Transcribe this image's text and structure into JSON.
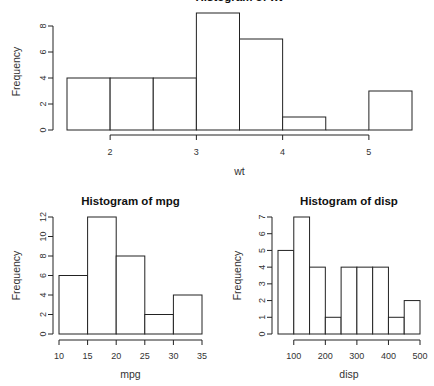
{
  "chart_data": [
    {
      "type": "bar",
      "title": "",
      "xlabel": "wt",
      "ylabel": "Frequency",
      "bin_edges": [
        1.5,
        2.0,
        2.5,
        3.0,
        3.5,
        4.0,
        4.5,
        5.0,
        5.5
      ],
      "values": [
        4,
        4,
        4,
        9,
        7,
        1,
        0,
        3
      ],
      "xticks": [
        "2",
        "3",
        "4",
        "5"
      ],
      "xtick_values": [
        2,
        3,
        4,
        5
      ],
      "yticks": [
        "0",
        "2",
        "4",
        "6",
        "8"
      ],
      "ylim": [
        0,
        9
      ],
      "grid": false
    },
    {
      "type": "bar",
      "title": "Histogram of mpg",
      "xlabel": "mpg",
      "ylabel": "Frequency",
      "bin_edges": [
        10,
        15,
        20,
        25,
        30,
        35
      ],
      "values": [
        6,
        12,
        8,
        2,
        4
      ],
      "xticks": [
        "10",
        "15",
        "20",
        "25",
        "30",
        "35"
      ],
      "xtick_values": [
        10,
        15,
        20,
        25,
        30,
        35
      ],
      "yticks": [
        "0",
        "2",
        "4",
        "6",
        "8",
        "10",
        "12"
      ],
      "ylim": [
        0,
        12
      ],
      "grid": false
    },
    {
      "type": "bar",
      "title": "Histogram of disp",
      "xlabel": "disp",
      "ylabel": "Frequency",
      "bin_edges": [
        50,
        100,
        150,
        200,
        250,
        300,
        350,
        400,
        450,
        500
      ],
      "values": [
        5,
        7,
        4,
        1,
        4,
        4,
        4,
        1,
        2
      ],
      "xticks": [
        "100",
        "200",
        "300",
        "400",
        "500"
      ],
      "xtick_values": [
        100,
        200,
        300,
        400,
        500
      ],
      "yticks": [
        "0",
        "1",
        "2",
        "3",
        "4",
        "5",
        "6",
        "7"
      ],
      "ylim": [
        0,
        7
      ],
      "grid": false
    }
  ]
}
